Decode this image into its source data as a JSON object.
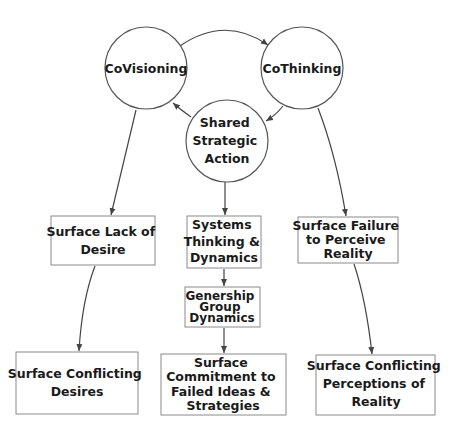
{
  "diagram": {
    "nodes": {
      "covisioning": {
        "label": [
          "CoVisioning"
        ]
      },
      "cothinking": {
        "label": [
          "CoThinking"
        ]
      },
      "shared_strategic_action": {
        "label": [
          "Shared",
          "Strategic",
          "Action"
        ]
      },
      "surface_lack_of_desire": {
        "label": [
          "Surface Lack of",
          "Desire"
        ]
      },
      "systems_thinking_dynamics": {
        "label": [
          "Systems",
          "Thinking &",
          "Dynamics"
        ]
      },
      "surface_failure_to_perceive_reality": {
        "label": [
          "Surface Failure",
          "to Perceive",
          "Reality"
        ]
      },
      "genership_group_dynamics": {
        "label": [
          "Genership",
          "Group",
          "Dynamics"
        ]
      },
      "surface_conflicting_desires": {
        "label": [
          "Surface Conflicting",
          "Desires"
        ]
      },
      "surface_commitment_failed_ideas": {
        "label": [
          "Surface",
          "Commitment to",
          "Failed Ideas &",
          "Strategies"
        ]
      },
      "surface_conflicting_perceptions": {
        "label": [
          "Surface Conflicting",
          "Perceptions of",
          "Reality"
        ]
      }
    },
    "edges": [
      {
        "from": "covisioning",
        "to": "cothinking"
      },
      {
        "from": "cothinking",
        "to": "shared_strategic_action"
      },
      {
        "from": "shared_strategic_action",
        "to": "covisioning"
      },
      {
        "from": "covisioning",
        "to": "surface_lack_of_desire"
      },
      {
        "from": "shared_strategic_action",
        "to": "systems_thinking_dynamics"
      },
      {
        "from": "cothinking",
        "to": "surface_failure_to_perceive_reality"
      },
      {
        "from": "surface_lack_of_desire",
        "to": "surface_conflicting_desires"
      },
      {
        "from": "systems_thinking_dynamics",
        "to": "genership_group_dynamics"
      },
      {
        "from": "genership_group_dynamics",
        "to": "surface_commitment_failed_ideas"
      },
      {
        "from": "surface_failure_to_perceive_reality",
        "to": "surface_conflicting_perceptions"
      }
    ]
  }
}
